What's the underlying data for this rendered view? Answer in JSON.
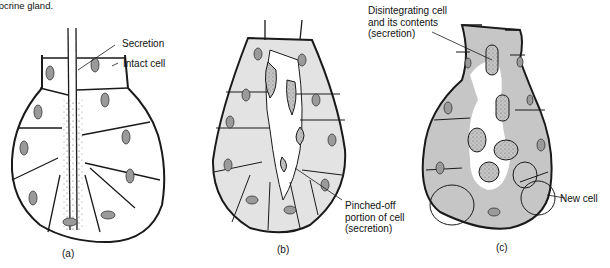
{
  "figure": {
    "caption_fragment": "holocrine gland.",
    "colors": {
      "outline": "#1a1a1a",
      "cell_fill_a": "#ffffff",
      "cell_fill_b": "#e6e6e6",
      "cell_fill_c": "#c9c9c9",
      "nucleus": "#8a8a8a"
    },
    "panels": [
      {
        "id": "a",
        "label": "(a)",
        "annotations": [
          {
            "text": "Secretion"
          },
          {
            "text": "Intact cell"
          }
        ]
      },
      {
        "id": "b",
        "label": "(b)",
        "annotations": [
          {
            "text": "Pinched-off\nportion of cell\n(secretion)"
          }
        ]
      },
      {
        "id": "c",
        "label": "(c)",
        "annotations": [
          {
            "text": "Disintegrating cell\nand its contents\n(secretion)"
          },
          {
            "text": "New cell"
          }
        ]
      }
    ]
  }
}
